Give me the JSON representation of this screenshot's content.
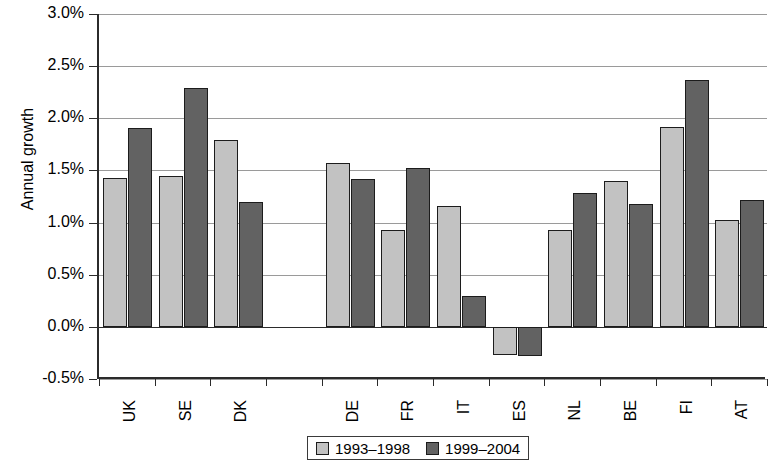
{
  "chart_data": {
    "type": "bar",
    "title": "",
    "xlabel": "",
    "ylabel": "Annual growth",
    "ylim": [
      -0.5,
      3.0
    ],
    "ytick_step": 0.5,
    "grid": true,
    "legend_position": "bottom",
    "value_suffix": "%",
    "categories": [
      "UK",
      "SE",
      "DK",
      "",
      "DE",
      "FR",
      "IT",
      "ES",
      "NL",
      "BE",
      "FI",
      "AT"
    ],
    "ytick_labels": [
      "3.0%",
      "2.5%",
      "2.0%",
      "1.5%",
      "1.0%",
      "0.5%",
      "0.0%",
      "-0.5%"
    ],
    "ytick_values": [
      3.0,
      2.5,
      2.0,
      1.5,
      1.0,
      0.5,
      0.0,
      -0.5
    ],
    "series": [
      {
        "name": "1993–1998",
        "color": "#c2c2c2",
        "values": [
          1.43,
          1.45,
          1.79,
          null,
          1.57,
          0.93,
          1.16,
          -0.27,
          0.93,
          1.4,
          1.92,
          1.02
        ]
      },
      {
        "name": "1999–2004",
        "color": "#626262",
        "values": [
          1.91,
          2.29,
          1.2,
          null,
          1.42,
          1.52,
          0.3,
          -0.28,
          1.28,
          1.18,
          2.37,
          1.22
        ]
      }
    ]
  },
  "legend": {
    "entries": [
      {
        "label": "1993–1998",
        "swatch": "light-gray-swatch"
      },
      {
        "label": "1999–2004",
        "swatch": "dark-gray-swatch"
      }
    ]
  }
}
